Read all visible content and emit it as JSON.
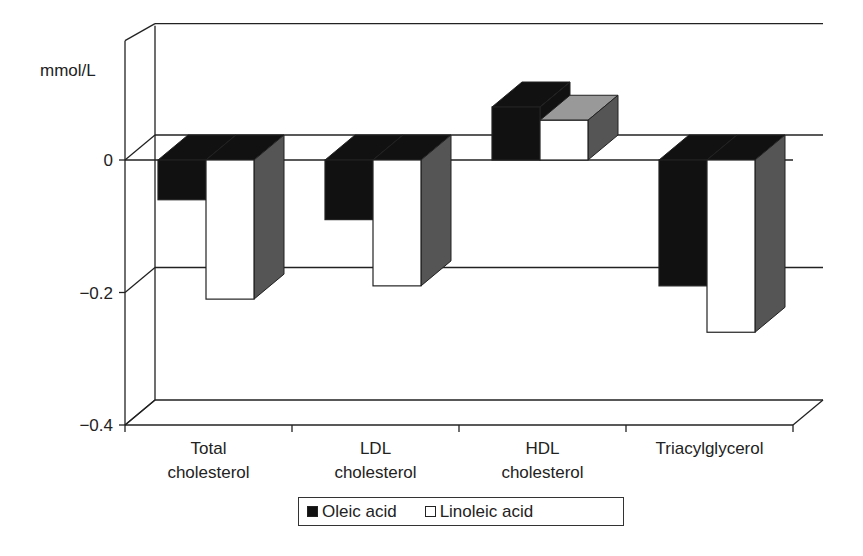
{
  "chart_data": {
    "type": "bar",
    "style": "3d-clustered-column",
    "title": "",
    "ylabel": "mmol/L",
    "xlabel": "",
    "categories": [
      "Total cholesterol",
      "LDL cholesterol",
      "HDL cholesterol",
      "Triacylglycerol"
    ],
    "category_lines": [
      [
        "Total",
        "cholesterol"
      ],
      [
        "LDL",
        "cholesterol"
      ],
      [
        "HDL",
        "cholesterol"
      ],
      [
        "Triacylglycerol"
      ]
    ],
    "series": [
      {
        "name": "Oleic acid",
        "color": "#111111",
        "values": [
          -0.06,
          -0.09,
          0.08,
          -0.19
        ]
      },
      {
        "name": "Linoleic acid",
        "color": "#ffffff",
        "values": [
          -0.21,
          -0.19,
          0.06,
          -0.26
        ]
      }
    ],
    "yticks": [
      0,
      -0.2,
      -0.4
    ],
    "ytick_labels": [
      "0",
      "−0.2",
      "−0.4"
    ],
    "ylim": [
      -0.4,
      0.15
    ],
    "grid": true,
    "legend_position": "bottom"
  },
  "legend": {
    "items": [
      {
        "label": "Oleic acid",
        "color": "#111111"
      },
      {
        "label": "Linoleic acid",
        "color": "#ffffff"
      }
    ]
  }
}
